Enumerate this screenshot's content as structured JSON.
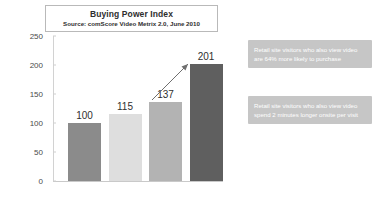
{
  "chart_data": {
    "type": "bar",
    "title": "Buying Power Index",
    "subtitle": "Source: comScore Video Metrix 2.0, June 2010",
    "categories": [
      "Total Internet",
      "Total Internet w/ Video",
      "Retail Site Visitors",
      "Retail Site Visitors w/ Video Viewing"
    ],
    "values": [
      100,
      115,
      137,
      201
    ],
    "xlabel": "",
    "ylabel": "",
    "ylim": [
      0,
      250
    ],
    "yticks": [
      0,
      50,
      100,
      150,
      200,
      250
    ],
    "grid": false,
    "legend": "none",
    "bar_colors": [
      "#8b8b8b",
      "#dedede",
      "#b3b3b3",
      "#5f5f5f"
    ],
    "annotations": [
      "Retail site visitors who also view video are 64% more likely to purchase",
      "Retail site visitors who also view video spend 2 minutes longer onsite per visit"
    ]
  },
  "callouts": [
    {
      "text": "Retail site visitors who also view video are 64% more likely to purchase"
    },
    {
      "text": "Retail site visitors who also view video spend 2 minutes longer onsite per visit"
    }
  ],
  "colors": {
    "callout_bg": "#c6c6c6",
    "callout_text": "#ffffff",
    "axis": "#cfcfcf",
    "text": "#2e2e2e"
  }
}
